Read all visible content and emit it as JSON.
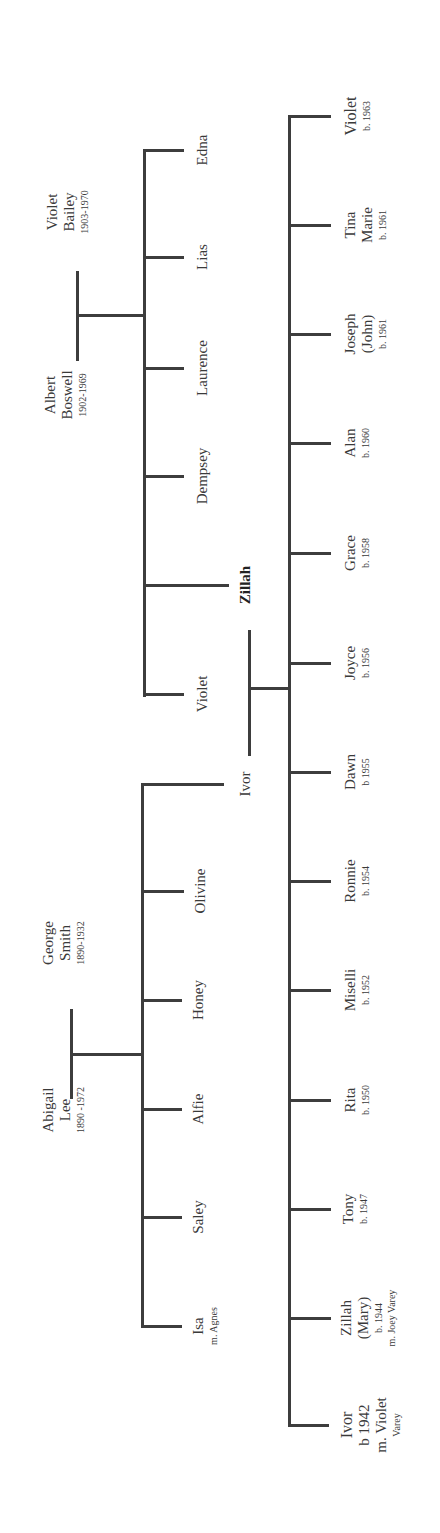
{
  "diagram": {
    "type": "family-tree",
    "orientation": "rotated-90-ccw",
    "line_color": "#3d3d3d",
    "text_color": "#3a3a3a"
  },
  "grandparents_boswell": {
    "husband": {
      "name1": "Albert",
      "name2": "Boswell",
      "dates": "1902-1969"
    },
    "wife": {
      "name1": "Violet",
      "name2": "Bailey",
      "dates": "1903-1970"
    },
    "children": [
      {
        "name": "Edna"
      },
      {
        "name": "Lias"
      },
      {
        "name": "Laurence"
      },
      {
        "name": "Dempsey"
      },
      {
        "name": "Zillah",
        "bold": true
      },
      {
        "name": "Violet"
      }
    ]
  },
  "grandparents_smith": {
    "wife": {
      "name1": "Abigail",
      "name2": "Lee",
      "dates": "1890 -1972"
    },
    "husband": {
      "name1": "George",
      "name2": "Smith",
      "dates": "1890-1932"
    },
    "children": [
      {
        "name": "Ivor"
      },
      {
        "name": "Olivine"
      },
      {
        "name": "Honey"
      },
      {
        "name": "Alfie"
      },
      {
        "name": "Saley"
      },
      {
        "name": "Isa",
        "note": "m. Agnes"
      }
    ]
  },
  "parents": {
    "father": "Ivor",
    "mother": "Zillah"
  },
  "children": [
    {
      "lines": [
        "Violet"
      ],
      "born": "b. 1963",
      "bold": true
    },
    {
      "lines": [
        "Tina",
        "Marie"
      ],
      "born": "b. 1961"
    },
    {
      "lines": [
        "Joseph",
        "(John)"
      ],
      "born": "b. 1961"
    },
    {
      "lines": [
        "Alan"
      ],
      "born": "b. 1960"
    },
    {
      "lines": [
        "Grace"
      ],
      "born": "b. 1958"
    },
    {
      "lines": [
        "Joyce"
      ],
      "born": "b. 1956"
    },
    {
      "lines": [
        "Dawn"
      ],
      "born": "b 1955"
    },
    {
      "lines": [
        "Ronnie"
      ],
      "born": "b. 1954"
    },
    {
      "lines": [
        "Miselli"
      ],
      "born": "b. 1952"
    },
    {
      "lines": [
        "Rita"
      ],
      "born": "b. 1950"
    },
    {
      "lines": [
        "Tony"
      ],
      "born": "b. 1947"
    },
    {
      "lines": [
        "Zillah",
        "(Mary)"
      ],
      "born": "b. 1944",
      "note": "m. Joey Varey"
    },
    {
      "lines": [
        "Ivor"
      ],
      "born": "b 1942",
      "note1": "m. Violet",
      "note2": "Varey",
      "bold": true
    }
  ]
}
